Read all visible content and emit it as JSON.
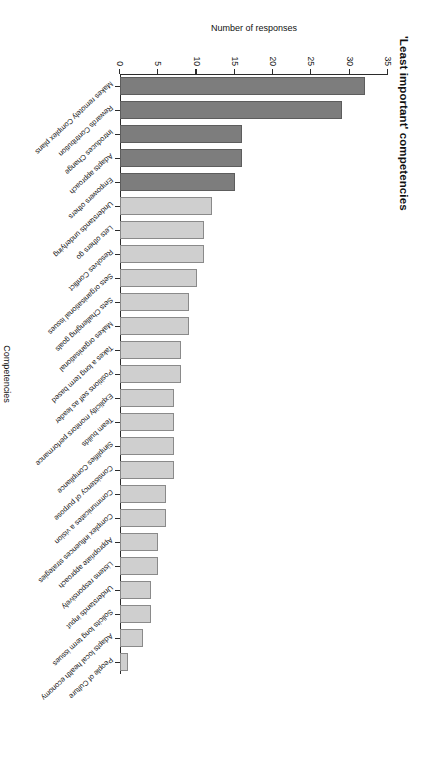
{
  "chart_data": {
    "type": "bar",
    "title": "'Least important' competencies",
    "xlabel": "Competencies",
    "ylabel": "Number of responses",
    "ylim": [
      0,
      35
    ],
    "yticks": [
      0,
      5,
      10,
      15,
      20,
      25,
      30,
      35
    ],
    "grid": false,
    "legend": "none",
    "orientation": "vertical",
    "categories": [
      "Makes remotely Complex plans",
      "Rewards Contribution",
      "Introduces Change",
      "Adapts approach",
      "Empowers others",
      "Understands underlying",
      "Lets others go",
      "Resolves Conflict",
      "Sets organisational issues",
      "Sets Challenging goals",
      "Makes organisational",
      "Takes a long term based",
      "Positions self as leader",
      "Explicitly monitors performance",
      "Team builds",
      "Simplifies Compliance",
      "Consistency of purpose",
      "Communicates a vision",
      "Complex influences strategies",
      "Appropriate approach",
      "Listens responsively",
      "Understands input",
      "Solicits long term issues",
      "Adapts local health economy",
      "People of Culture"
    ],
    "values": [
      32,
      29,
      16,
      16,
      15,
      12,
      11,
      11,
      10,
      9,
      9,
      8,
      8,
      7,
      7,
      7,
      7,
      6,
      6,
      5,
      5,
      4,
      4,
      3,
      1
    ],
    "bar_shades": [
      "dark",
      "dark",
      "dark",
      "dark",
      "dark",
      "light",
      "light",
      "light",
      "light",
      "light",
      "light",
      "light",
      "light",
      "light",
      "light",
      "light",
      "light",
      "light",
      "light",
      "light",
      "light",
      "light",
      "light",
      "light",
      "light"
    ],
    "colors": {
      "dark_bar": "#7d7d7d",
      "light_bar": "#cfcfcf",
      "axis": "#2b2b2b",
      "text": "#141414",
      "background": "#ffffff"
    }
  }
}
